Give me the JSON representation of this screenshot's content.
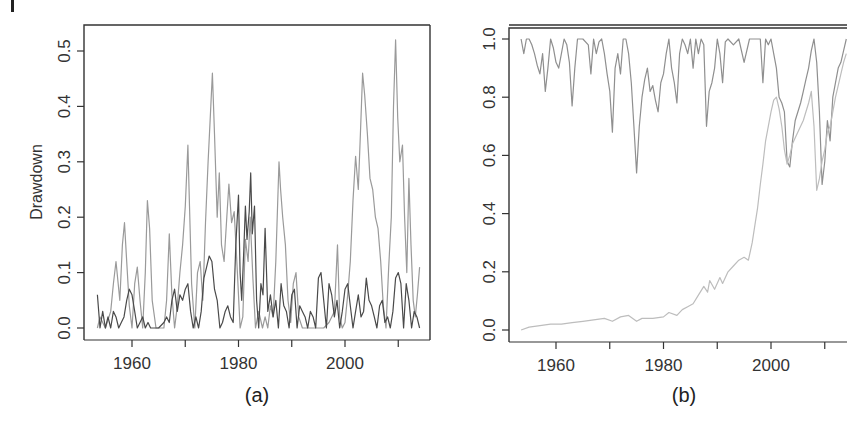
{
  "chart_data": [
    {
      "panel": "(a)",
      "type": "line",
      "title": "",
      "caption": "(a)",
      "xlabel": "",
      "ylabel": "Drawdown",
      "xlim": [
        1951,
        2016
      ],
      "ylim": [
        -0.02,
        0.55
      ],
      "xticks": [
        1960,
        1970,
        1980,
        1990,
        2000,
        2010
      ],
      "xtick_labels": [
        "1960",
        "",
        "1980",
        "",
        "2000",
        ""
      ],
      "yticks": [
        0.0,
        0.1,
        0.2,
        0.3,
        0.4,
        0.5
      ],
      "ytick_labels": [
        "0.0",
        "0.1",
        "0.2",
        "0.3",
        "0.4",
        "0.5"
      ],
      "grid": false,
      "legend": null,
      "series": [
        {
          "name": "light-gray-series",
          "color": "#9a9a9a",
          "x": [
            1953.5,
            1954,
            1955,
            1956,
            1956.5,
            1957,
            1957.7,
            1958.2,
            1958.6,
            1959,
            1959.5,
            1960,
            1960.5,
            1961,
            1961.5,
            1962,
            1962.5,
            1962.9,
            1963.3,
            1963.8,
            1964.5,
            1965,
            1966,
            1966.5,
            1967,
            1967.5,
            1968,
            1968.5,
            1969,
            1969.5,
            1970,
            1970.5,
            1970.8,
            1971.2,
            1971.8,
            1972.3,
            1972.8,
            1973.3,
            1973.8,
            1974.3,
            1974.8,
            1975.1,
            1975.5,
            1976,
            1976.4,
            1976.8,
            1977.3,
            1977.8,
            1978.2,
            1978.7,
            1979.2,
            1979.8,
            1980.3,
            1980.8,
            1981.3,
            1981.8,
            1982.2,
            1982.7,
            1983.2,
            1983.8,
            1984.5,
            1985,
            1985.5,
            1986,
            1986.5,
            1987,
            1987.6,
            1987.9,
            1988.3,
            1988.8,
            1989.3,
            1989.8,
            1990.3,
            1990.8,
            1991.3,
            1992,
            1993,
            1994,
            1995,
            1996,
            1997,
            1998,
            1998.6,
            1999,
            1999.5,
            2000,
            2000.5,
            2001,
            2001.5,
            2002,
            2002.5,
            2002.9,
            2003.3,
            2003.7,
            2004.2,
            2004.7,
            2005.2,
            2005.7,
            2006.2,
            2006.7,
            2007.2,
            2007.7,
            2008.2,
            2008.7,
            2009.1,
            2009.5,
            2009.9,
            2010.3,
            2010.8,
            2011.2,
            2011.6,
            2012,
            2012.4,
            2012.8,
            2013.2,
            2013.6,
            2014
          ],
          "y": [
            0.0,
            0.02,
            0.0,
            0.03,
            0.08,
            0.12,
            0.05,
            0.15,
            0.19,
            0.12,
            0.04,
            0.0,
            0.08,
            0.11,
            0.05,
            0.0,
            0.1,
            0.23,
            0.18,
            0.05,
            0.0,
            0.0,
            0.0,
            0.05,
            0.17,
            0.06,
            0.0,
            0.04,
            0.1,
            0.15,
            0.22,
            0.33,
            0.22,
            0.08,
            0.0,
            0.1,
            0.12,
            0.05,
            0.19,
            0.3,
            0.4,
            0.46,
            0.35,
            0.2,
            0.28,
            0.15,
            0.12,
            0.2,
            0.26,
            0.19,
            0.21,
            0.1,
            0.0,
            0.02,
            0.16,
            0.12,
            0.2,
            0.09,
            0.0,
            0.03,
            0.0,
            0.02,
            0.0,
            0.04,
            0.02,
            0.12,
            0.3,
            0.25,
            0.2,
            0.15,
            0.05,
            0.01,
            0.08,
            0.1,
            0.02,
            0.0,
            0.0,
            0.0,
            0.0,
            0.0,
            0.01,
            0.03,
            0.15,
            0.02,
            0.0,
            0.01,
            0.06,
            0.12,
            0.23,
            0.31,
            0.25,
            0.35,
            0.46,
            0.42,
            0.35,
            0.27,
            0.25,
            0.2,
            0.18,
            0.12,
            0.04,
            0.0,
            0.11,
            0.2,
            0.4,
            0.52,
            0.38,
            0.3,
            0.33,
            0.2,
            0.1,
            0.27,
            0.15,
            0.05,
            0.02,
            0.06,
            0.11
          ]
        },
        {
          "name": "dark-gray-series",
          "color": "#4a4a4a",
          "x": [
            1953.5,
            1954,
            1954.5,
            1955,
            1955.5,
            1956,
            1956.5,
            1957,
            1957.5,
            1958,
            1958.5,
            1959,
            1959.5,
            1960,
            1960.5,
            1961,
            1961.5,
            1962,
            1962.5,
            1963,
            1963.5,
            1964,
            1965,
            1966,
            1966.5,
            1967,
            1967.5,
            1968,
            1968.5,
            1969,
            1969.5,
            1970,
            1970.5,
            1971,
            1971.5,
            1972,
            1972.5,
            1973,
            1973.5,
            1974,
            1974.5,
            1975,
            1975.5,
            1976,
            1976.5,
            1977,
            1977.5,
            1978,
            1978.5,
            1979,
            1979.5,
            1980,
            1980.3,
            1980.6,
            1981,
            1981.3,
            1981.6,
            1982,
            1982.3,
            1982.6,
            1983,
            1983.4,
            1983.8,
            1984.2,
            1984.6,
            1985,
            1985.5,
            1986,
            1986.5,
            1987,
            1987.5,
            1988,
            1988.5,
            1989,
            1989.5,
            1990,
            1990.5,
            1991,
            1991.5,
            1992,
            1992.5,
            1993,
            1993.5,
            1994,
            1994.5,
            1995,
            1995.5,
            1996,
            1996.5,
            1997,
            1997.5,
            1998,
            1998.5,
            1999,
            1999.5,
            2000,
            2000.5,
            2001,
            2001.5,
            2002,
            2002.5,
            2003,
            2003.5,
            2004,
            2004.5,
            2005,
            2005.5,
            2006,
            2006.5,
            2007,
            2007.5,
            2008,
            2008.5,
            2009,
            2009.5,
            2010,
            2010.5,
            2011,
            2011.5,
            2012,
            2012.5,
            2013,
            2013.5,
            2014
          ],
          "y": [
            0.06,
            0.0,
            0.03,
            0.0,
            0.02,
            0.0,
            0.03,
            0.02,
            0.0,
            0.01,
            0.02,
            0.05,
            0.07,
            0.06,
            0.03,
            0.0,
            0.01,
            0.02,
            0.0,
            0.01,
            0.0,
            0.0,
            0.0,
            0.01,
            0.02,
            0.01,
            0.05,
            0.07,
            0.03,
            0.06,
            0.05,
            0.07,
            0.08,
            0.03,
            0.0,
            0.02,
            0.0,
            0.03,
            0.09,
            0.11,
            0.13,
            0.12,
            0.07,
            0.05,
            0.0,
            0.01,
            0.03,
            0.04,
            0.02,
            0.01,
            0.15,
            0.24,
            0.1,
            0.05,
            0.14,
            0.22,
            0.16,
            0.21,
            0.28,
            0.17,
            0.22,
            0.05,
            0.0,
            0.08,
            0.06,
            0.18,
            0.03,
            0.06,
            0.02,
            0.05,
            0.0,
            0.08,
            0.04,
            0.03,
            0.0,
            0.06,
            0.07,
            0.0,
            0.04,
            0.03,
            0.02,
            0.0,
            0.03,
            0.02,
            0.0,
            0.09,
            0.1,
            0.05,
            0.0,
            0.08,
            0.06,
            0.02,
            0.05,
            0.0,
            0.03,
            0.07,
            0.08,
            0.04,
            0.0,
            0.03,
            0.06,
            0.02,
            0.03,
            0.09,
            0.05,
            0.04,
            0.02,
            0.0,
            0.04,
            0.05,
            0.01,
            0.02,
            0.0,
            0.03,
            0.09,
            0.1,
            0.08,
            0.0,
            0.08,
            0.05,
            0.0,
            0.03,
            0.02,
            0.0
          ]
        }
      ]
    },
    {
      "panel": "(b)",
      "type": "line",
      "title": "",
      "caption": "(b)",
      "xlabel": "",
      "ylabel": "",
      "xlim": [
        1951,
        2015
      ],
      "ylim": [
        -0.04,
        1.05
      ],
      "xticks": [
        1960,
        1970,
        1980,
        1990,
        2000,
        2010
      ],
      "xtick_labels": [
        "1960",
        "",
        "1980",
        "",
        "2000",
        ""
      ],
      "yticks": [
        0.0,
        0.2,
        0.4,
        0.6,
        0.8,
        1.0
      ],
      "ytick_labels": [
        "0.0",
        "0.2",
        "0.4",
        "0.6",
        "0.8",
        "1.0"
      ],
      "grid": false,
      "legend": null,
      "series": [
        {
          "name": "upper-ratio-series",
          "color": "#8f8f8f",
          "x": [
            1953.5,
            1954,
            1954.5,
            1955,
            1955.5,
            1956,
            1956.5,
            1957,
            1957.5,
            1958,
            1958.5,
            1959,
            1959.5,
            1960,
            1960.5,
            1961,
            1961.5,
            1962,
            1962.5,
            1963,
            1963.5,
            1964,
            1965,
            1966,
            1966.5,
            1967,
            1967.5,
            1968,
            1968.5,
            1969,
            1969.5,
            1970,
            1970.5,
            1971,
            1971.5,
            1972,
            1972.5,
            1973,
            1973.5,
            1974,
            1974.5,
            1975,
            1975.5,
            1976,
            1976.5,
            1977,
            1977.5,
            1978,
            1978.5,
            1979,
            1979.5,
            1980,
            1980.5,
            1981,
            1981.5,
            1982,
            1982.5,
            1983,
            1983.5,
            1984,
            1984.5,
            1985,
            1985.5,
            1986,
            1986.5,
            1987,
            1987.5,
            1988,
            1988.5,
            1989,
            1989.5,
            1990,
            1990.5,
            1991,
            1991.5,
            1992,
            1993,
            1994,
            1995,
            1996,
            1997,
            1998,
            1998.5,
            1999,
            1999.5,
            2000,
            2000.5,
            2001,
            2001.5,
            2002,
            2002.5,
            2003,
            2003.5,
            2004,
            2004.5,
            2005,
            2005.5,
            2006,
            2006.5,
            2007,
            2007.5,
            2008,
            2008.5,
            2009,
            2009.5,
            2010,
            2010.5,
            2011,
            2011.5,
            2012,
            2012.5,
            2013,
            2013.5,
            2014
          ],
          "y": [
            1.0,
            0.95,
            1.0,
            1.0,
            0.98,
            0.95,
            0.91,
            0.88,
            0.95,
            0.82,
            0.9,
            1.0,
            0.97,
            0.92,
            0.9,
            0.95,
            1.0,
            0.98,
            0.92,
            0.77,
            0.9,
            1.0,
            1.0,
            0.98,
            0.88,
            1.0,
            0.95,
            0.99,
            1.0,
            0.95,
            0.88,
            0.82,
            0.68,
            0.9,
            0.95,
            0.88,
            1.0,
            1.0,
            0.95,
            0.85,
            0.7,
            0.54,
            0.7,
            0.8,
            0.86,
            0.9,
            0.82,
            0.84,
            0.79,
            0.75,
            0.85,
            0.88,
            0.95,
            1.0,
            0.9,
            0.85,
            0.78,
            0.95,
            1.0,
            0.98,
            0.95,
            1.0,
            0.9,
            1.0,
            0.95,
            1.0,
            0.98,
            0.7,
            0.82,
            0.85,
            0.9,
            1.0,
            0.95,
            0.85,
            0.99,
            1.0,
            0.98,
            1.0,
            0.92,
            1.0,
            1.0,
            1.0,
            0.85,
            1.0,
            0.98,
            1.0,
            0.95,
            0.9,
            0.8,
            0.78,
            0.75,
            0.58,
            0.56,
            0.65,
            0.72,
            0.75,
            0.78,
            0.82,
            0.86,
            0.9,
            0.96,
            1.0,
            0.92,
            0.75,
            0.5,
            0.58,
            0.72,
            0.65,
            0.8,
            0.85,
            0.9,
            0.92,
            0.96,
            1.0
          ],
          "y_note": "approximate envelope read from pixels"
        },
        {
          "name": "lower-rising-series",
          "color": "#bdbdbd",
          "x": [
            1953.5,
            1955,
            1957,
            1959,
            1961,
            1963,
            1965,
            1967,
            1969,
            1970.5,
            1972,
            1973.5,
            1975,
            1976,
            1978,
            1980,
            1981,
            1982.5,
            1983.5,
            1984.5,
            1985.5,
            1986.5,
            1987.5,
            1988.2,
            1988.6,
            1989.5,
            1990.5,
            1991,
            1992,
            1993,
            1994,
            1995,
            1995.8,
            1996.5,
            1997,
            1997.5,
            1998,
            1998.5,
            1999,
            1999.5,
            2000,
            2000.5,
            2001,
            2001.5,
            2002,
            2002.5,
            2003,
            2003.5,
            2004,
            2005,
            2006,
            2007,
            2007.5,
            2008,
            2008.5,
            2009,
            2009.5,
            2010,
            2010.5,
            2011,
            2011.5,
            2012,
            2012.5,
            2013,
            2013.5,
            2014
          ],
          "y": [
            0.0,
            0.01,
            0.015,
            0.02,
            0.02,
            0.025,
            0.03,
            0.035,
            0.04,
            0.03,
            0.045,
            0.05,
            0.03,
            0.04,
            0.04,
            0.045,
            0.06,
            0.05,
            0.07,
            0.08,
            0.09,
            0.12,
            0.15,
            0.13,
            0.17,
            0.14,
            0.18,
            0.16,
            0.2,
            0.22,
            0.24,
            0.25,
            0.24,
            0.3,
            0.36,
            0.42,
            0.5,
            0.57,
            0.65,
            0.7,
            0.75,
            0.79,
            0.8,
            0.76,
            0.7,
            0.62,
            0.57,
            0.6,
            0.64,
            0.68,
            0.72,
            0.78,
            0.82,
            0.7,
            0.48,
            0.52,
            0.58,
            0.62,
            0.68,
            0.7,
            0.75,
            0.8,
            0.84,
            0.88,
            0.92,
            0.95
          ]
        }
      ]
    }
  ],
  "figure": {
    "panel_a": {
      "caption": "(a)",
      "ylabel": "Drawdown"
    },
    "panel_b": {
      "caption": "(b)"
    }
  }
}
